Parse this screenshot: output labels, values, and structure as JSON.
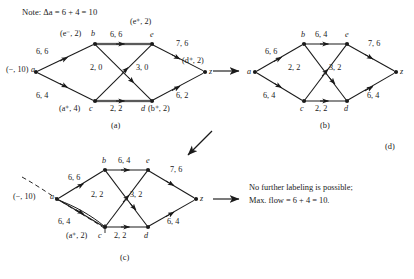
{
  "figure": {
    "note": "Note: Δa = 6 + 4 = 10",
    "panels": {
      "a_id": "(a)",
      "b_id": "(b)",
      "c_id": "(c)",
      "d_id": "(d)"
    }
  },
  "panel_a": {
    "nodes": {
      "a": "a",
      "b": "b",
      "c": "c",
      "d": "d",
      "e": "e",
      "z": "z"
    },
    "labels": {
      "a": "(−, 10)",
      "b": "(e⁻, 2)",
      "c": "(a⁺, 4)",
      "d": "(b⁺, 2)",
      "e": "(e⁺, 2)",
      "z": "(d⁺, 2)"
    },
    "edges": {
      "ab": "6, 6",
      "ac": "6, 4",
      "be": "6, 6",
      "bd": "3, 0",
      "ce": "2, 0",
      "cd": "2, 2",
      "ez": "7, 6",
      "dz": "6, 2"
    }
  },
  "panel_b": {
    "nodes": {
      "a": "a",
      "b": "b",
      "c": "c",
      "d": "d",
      "e": "e",
      "z": "z"
    },
    "edges": {
      "ab": "6, 6",
      "ac": "6, 4",
      "be": "6, 4",
      "bd": "3, 2",
      "ce": "2, 2",
      "cd": "2, 2",
      "ez": "7, 6",
      "dz": "6, 4"
    }
  },
  "panel_c": {
    "nodes": {
      "a": "a",
      "b": "b",
      "c": "c",
      "d": "d",
      "e": "e",
      "z": "z"
    },
    "labels": {
      "a": "(−, 10)",
      "c": "(a⁺, 2)"
    },
    "edges": {
      "ab": "6, 6",
      "ac": "6, 4",
      "be": "6, 4",
      "bd": "3, 2",
      "ce": "2, 2",
      "cd": "2, 2",
      "ez": "7, 6",
      "dz": "6, 4"
    }
  },
  "panel_d": {
    "line1": "No further labeling is possible;",
    "line2": "Max. flow = 6 + 4 = 10."
  },
  "colors": {
    "ink": "#1a1a1a",
    "saturated_edge": "#8f8f8f",
    "background": "#ffffff"
  }
}
